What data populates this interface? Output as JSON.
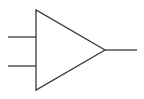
{
  "diagram": {
    "title": "",
    "type": "amplifier-symbol",
    "stroke_color": "#3a3a3a",
    "background": "#ffffff",
    "triangle": {
      "points": [
        [
          36,
          10
        ],
        [
          36,
          90
        ],
        [
          105,
          50
        ]
      ]
    },
    "inputs": [
      {
        "name": "input-1",
        "x1": 8,
        "y1": 37,
        "x2": 36,
        "y2": 37
      },
      {
        "name": "input-2",
        "x1": 8,
        "y1": 66,
        "x2": 36,
        "y2": 66
      }
    ],
    "output": {
      "name": "output",
      "x1": 105,
      "y1": 50,
      "x2": 137,
      "y2": 50
    }
  }
}
